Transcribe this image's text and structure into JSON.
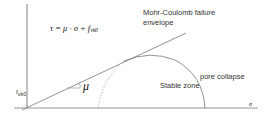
{
  "diagram": {
    "formula": {
      "lhs": "τ = μ · σ + f",
      "subscript": "vk0"
    },
    "labels": {
      "envelope_line1": "Mohr-Coulomb failure",
      "envelope_line2": "envelope",
      "stable_zone": "Stable zone",
      "pore_collapse": "pore collapse",
      "friction_coefficient": "μ",
      "cohesion_symbol": "f",
      "cohesion_subscript": "vk0",
      "x_axis": "σ",
      "y_axis": "τ"
    },
    "colors": {
      "axis": "#555555",
      "envelope": "#666666",
      "curve": "#777777",
      "dashed": "#999999",
      "text": "#333333"
    }
  }
}
